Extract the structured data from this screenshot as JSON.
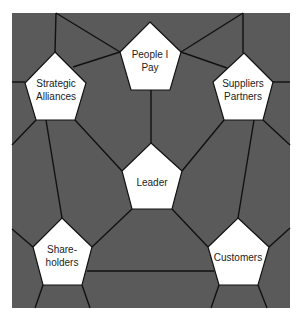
{
  "diagram": {
    "background_color": "#5a5a5a",
    "node_color": "#ffffff",
    "edge_color": "#111111",
    "nodes": [
      {
        "id": "people-i-pay",
        "label": "People I\nPay",
        "cx": 150,
        "cy": 61
      },
      {
        "id": "strategic-alliances",
        "label": "Strategic\nAlliances",
        "cx": 56,
        "cy": 90
      },
      {
        "id": "suppliers-partners",
        "label": "Suppliers\nPartners",
        "cx": 243,
        "cy": 90
      },
      {
        "id": "leader",
        "label": "Leader",
        "cx": 152,
        "cy": 182
      },
      {
        "id": "shareholders",
        "label": "Share-\nholders",
        "cx": 62,
        "cy": 256
      },
      {
        "id": "customers",
        "label": "Customers",
        "cx": 238,
        "cy": 257
      }
    ]
  }
}
